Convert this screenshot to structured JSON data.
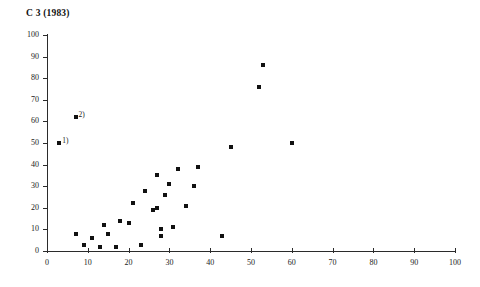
{
  "chart_data": {
    "type": "scatter",
    "title": "C 3 (1983)",
    "xlabel": "",
    "ylabel": "",
    "xlim": [
      0,
      100
    ],
    "ylim": [
      0,
      100
    ],
    "grid": false,
    "legend": null,
    "x_ticks": [
      0,
      10,
      20,
      30,
      40,
      50,
      60,
      70,
      80,
      90,
      100
    ],
    "y_ticks": [
      0,
      10,
      20,
      30,
      40,
      50,
      60,
      70,
      80,
      90,
      100
    ],
    "marker": "filled-square",
    "marker_color": "#111111",
    "points": [
      {
        "x": 3,
        "y": 50,
        "annotation": "1)"
      },
      {
        "x": 7,
        "y": 62,
        "annotation": "2)"
      },
      {
        "x": 7,
        "y": 8,
        "annotation": ""
      },
      {
        "x": 9,
        "y": 3,
        "annotation": ""
      },
      {
        "x": 11,
        "y": 6,
        "annotation": ""
      },
      {
        "x": 13,
        "y": 2,
        "annotation": ""
      },
      {
        "x": 14,
        "y": 12,
        "annotation": ""
      },
      {
        "x": 15,
        "y": 8,
        "annotation": ""
      },
      {
        "x": 17,
        "y": 2,
        "annotation": ""
      },
      {
        "x": 18,
        "y": 14,
        "annotation": ""
      },
      {
        "x": 20,
        "y": 13,
        "annotation": ""
      },
      {
        "x": 21,
        "y": 22,
        "annotation": ""
      },
      {
        "x": 23,
        "y": 3,
        "annotation": ""
      },
      {
        "x": 24,
        "y": 28,
        "annotation": ""
      },
      {
        "x": 26,
        "y": 19,
        "annotation": ""
      },
      {
        "x": 27,
        "y": 20,
        "annotation": ""
      },
      {
        "x": 27,
        "y": 35,
        "annotation": ""
      },
      {
        "x": 28,
        "y": 10,
        "annotation": ""
      },
      {
        "x": 28,
        "y": 7,
        "annotation": ""
      },
      {
        "x": 29,
        "y": 26,
        "annotation": ""
      },
      {
        "x": 30,
        "y": 31,
        "annotation": ""
      },
      {
        "x": 31,
        "y": 11,
        "annotation": ""
      },
      {
        "x": 32,
        "y": 38,
        "annotation": ""
      },
      {
        "x": 34,
        "y": 21,
        "annotation": ""
      },
      {
        "x": 36,
        "y": 30,
        "annotation": ""
      },
      {
        "x": 37,
        "y": 39,
        "annotation": ""
      },
      {
        "x": 43,
        "y": 7,
        "annotation": ""
      },
      {
        "x": 45,
        "y": 48,
        "annotation": ""
      },
      {
        "x": 52,
        "y": 76,
        "annotation": ""
      },
      {
        "x": 53,
        "y": 86,
        "annotation": ""
      },
      {
        "x": 60,
        "y": 50,
        "annotation": ""
      }
    ]
  }
}
